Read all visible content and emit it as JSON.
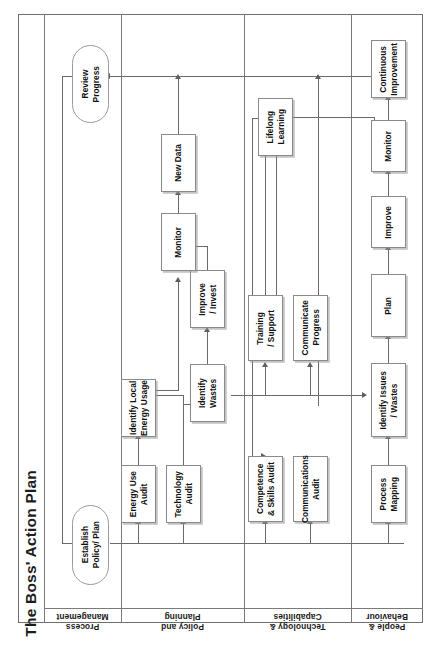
{
  "diagram": {
    "title": "The Boss' Action Plan",
    "orientation": "rotated-90-ccw",
    "lanes": [
      {
        "id": "policy",
        "label": "Policy and\nPlanning"
      },
      {
        "id": "technology",
        "label": "Technology &\nCapabilities"
      },
      {
        "id": "people",
        "label": "People &\nBehaviour"
      },
      {
        "id": "process",
        "label": "Process\nManagement"
      }
    ],
    "nodes": [
      {
        "id": "establish",
        "lane": "policy",
        "shape": "oval",
        "label": "Establish\nPolicy/ Plan"
      },
      {
        "id": "review",
        "lane": "policy",
        "shape": "oval",
        "label": "Review\nProgress"
      },
      {
        "id": "energy_audit",
        "lane": "technology",
        "shape": "box",
        "label": "Energy Use\nAudit"
      },
      {
        "id": "tech_audit",
        "lane": "technology",
        "shape": "box",
        "label": "Technology\nAudit"
      },
      {
        "id": "id_local",
        "lane": "technology",
        "shape": "box",
        "label": "Identify Local\nEnergy Usage"
      },
      {
        "id": "id_wastes_t",
        "lane": "technology",
        "shape": "box",
        "label": "Identify\nWastes"
      },
      {
        "id": "improve_inv",
        "lane": "technology",
        "shape": "box",
        "label": "Improve\n/ Invest"
      },
      {
        "id": "monitor_t",
        "lane": "technology",
        "shape": "box",
        "label": "Monitor"
      },
      {
        "id": "new_data",
        "lane": "technology",
        "shape": "box",
        "label": "New Data"
      },
      {
        "id": "comp_audit",
        "lane": "people",
        "shape": "box",
        "label": "Competence\n& Skills Audit"
      },
      {
        "id": "comms_audit",
        "lane": "people",
        "shape": "box",
        "label": "Communications\nAudit"
      },
      {
        "id": "training",
        "lane": "people",
        "shape": "box",
        "label": "Training\n/ Support"
      },
      {
        "id": "comm_prog",
        "lane": "people",
        "shape": "box",
        "label": "Communicate\nProgress"
      },
      {
        "id": "lifelong",
        "lane": "people",
        "shape": "box",
        "label": "Lifelong\nLearning"
      },
      {
        "id": "proc_map",
        "lane": "process",
        "shape": "box",
        "label": "Process\nMapping"
      },
      {
        "id": "id_issues",
        "lane": "process",
        "shape": "box",
        "label": "Identify Issues\n/ Wastes"
      },
      {
        "id": "plan",
        "lane": "process",
        "shape": "box",
        "label": "Plan"
      },
      {
        "id": "improve_p",
        "lane": "process",
        "shape": "box",
        "label": "Improve"
      },
      {
        "id": "monitor_p",
        "lane": "process",
        "shape": "box",
        "label": "Monitor"
      },
      {
        "id": "cont_improve",
        "lane": "process",
        "shape": "box",
        "label": "Continuous\nImprovement"
      }
    ],
    "colors": {
      "frame_border": "#6f6f6f",
      "node_border": "#8a8a8a",
      "connector": "#6a6a6a",
      "text": "#101010",
      "background": "#ffffff"
    }
  }
}
